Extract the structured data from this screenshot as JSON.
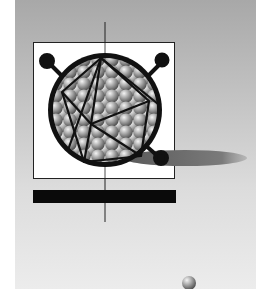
{
  "artwork": {
    "subject": "virus-capsid-illustration",
    "colors": {
      "background": "#ffffff",
      "panel_top": "#a8a8a8",
      "panel_bottom": "#ececec",
      "box_fill": "#ffffff",
      "outline": "#111111",
      "shadow": "#707070",
      "bar": "#0a0a0a"
    },
    "elements": [
      "vertical-axis-line",
      "white-box",
      "capsid-sphere",
      "icosahedron-outline",
      "spike-knobs",
      "cast-shadow",
      "black-bar",
      "small-sphere"
    ]
  }
}
